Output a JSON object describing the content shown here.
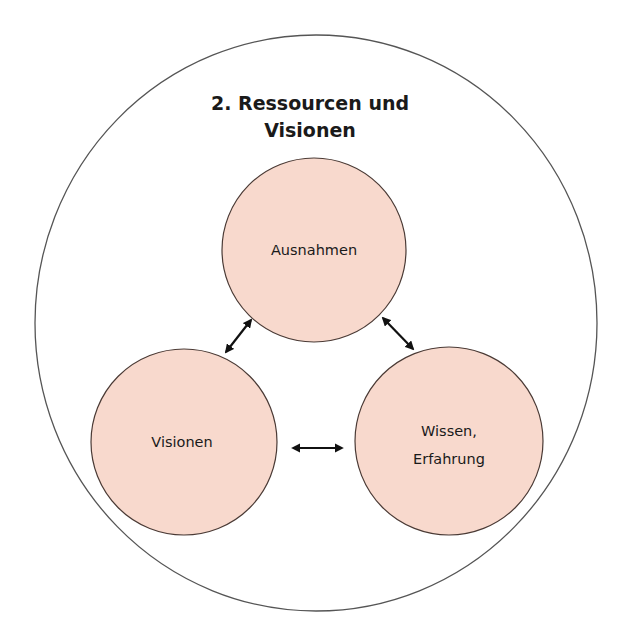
{
  "diagram": {
    "title_lines": [
      "2. Ressourcen und",
      "Visionen"
    ],
    "colors": {
      "background": "#ffffff",
      "outer_circle_stroke": "#555555",
      "node_fill": "#f8d9cd",
      "node_stroke": "#4a3a35",
      "arrow": "#111111",
      "text": "#1a1a1a"
    },
    "nodes": [
      {
        "id": "ausnahmen",
        "label_lines": [
          "Ausnahmen"
        ]
      },
      {
        "id": "visionen",
        "label_lines": [
          "Visionen"
        ]
      },
      {
        "id": "wissen",
        "label_lines": [
          "Wissen,",
          "Erfahrung"
        ]
      }
    ],
    "edges": [
      {
        "from": "ausnahmen",
        "to": "visionen",
        "type": "bidirectional-arrow"
      },
      {
        "from": "ausnahmen",
        "to": "wissen",
        "type": "bidirectional-arrow"
      },
      {
        "from": "visionen",
        "to": "wissen",
        "type": "bidirectional-arrow"
      }
    ]
  }
}
